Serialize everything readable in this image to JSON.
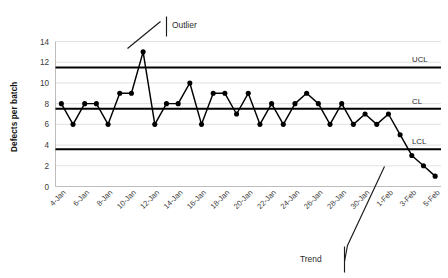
{
  "chart_data": {
    "type": "line",
    "title": "",
    "xlabel": "",
    "ylabel": "Defects per batch",
    "ylim": [
      0,
      14
    ],
    "ytick_step": 2,
    "yticks": [
      0,
      2,
      4,
      6,
      8,
      10,
      12,
      14
    ],
    "grid": true,
    "legend_position": "none",
    "x": [
      "4-Jan",
      "5-Jan",
      "6-Jan",
      "7-Jan",
      "8-Jan",
      "9-Jan",
      "10-Jan",
      "11-Jan",
      "12-Jan",
      "13-Jan",
      "14-Jan",
      "15-Jan",
      "16-Jan",
      "17-Jan",
      "18-Jan",
      "19-Jan",
      "20-Jan",
      "21-Jan",
      "22-Jan",
      "23-Jan",
      "24-Jan",
      "25-Jan",
      "26-Jan",
      "27-Jan",
      "28-Jan",
      "29-Jan",
      "30-Jan",
      "31-Jan",
      "1-Feb",
      "2-Feb",
      "3-Feb",
      "4-Feb",
      "5-Feb"
    ],
    "xtick_labels": [
      "4-Jan",
      "6-Jan",
      "8-Jan",
      "10-Jan",
      "12-Jan",
      "14-Jan",
      "16-Jan",
      "18-Jan",
      "20-Jan",
      "22-Jan",
      "24-Jan",
      "26-Jan",
      "28-Jan",
      "30-Jan",
      "1-Feb",
      "3-Feb",
      "5-Feb"
    ],
    "xtick_every": 2,
    "series": [
      {
        "name": "Defects per batch",
        "color": "#000000",
        "marker": "circle",
        "values": [
          8,
          6,
          8,
          8,
          6,
          9,
          9,
          13,
          6,
          8,
          8,
          10,
          6,
          9,
          9,
          7,
          9,
          6,
          8,
          6,
          8,
          9,
          8,
          6,
          8,
          6,
          7,
          6,
          7,
          5,
          3,
          2,
          1
        ]
      }
    ],
    "control_limits": [
      {
        "id": "ucl",
        "label": "UCL",
        "value": 11.5
      },
      {
        "id": "cl",
        "label": "CL",
        "value": 7.5
      },
      {
        "id": "lcl",
        "label": "LCL",
        "value": 3.6
      }
    ],
    "annotations": [
      {
        "id": "outlier",
        "label": "Outlier",
        "points_to": "11-Jan"
      },
      {
        "id": "trend",
        "label": "Trend",
        "points_to": "2-Feb"
      }
    ]
  }
}
